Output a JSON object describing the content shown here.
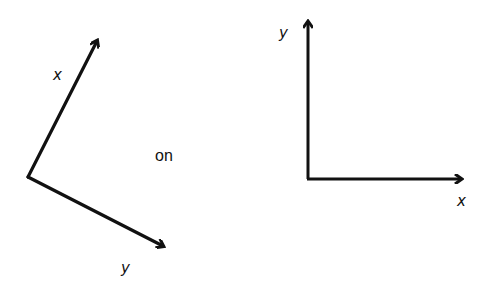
{
  "diagram": {
    "left_frame": {
      "x_label": "x",
      "y_label": "y",
      "origin": [
        28,
        177
      ],
      "x_tip": [
        97,
        39
      ],
      "y_tip": [
        165,
        247
      ]
    },
    "connector_text": "on",
    "right_frame": {
      "x_label": "x",
      "y_label": "y",
      "origin": [
        308,
        179
      ],
      "x_tip": [
        463,
        179
      ],
      "y_tip": [
        308,
        20
      ]
    },
    "colors": {
      "stroke": "#111111",
      "background": "#ffffff"
    }
  }
}
